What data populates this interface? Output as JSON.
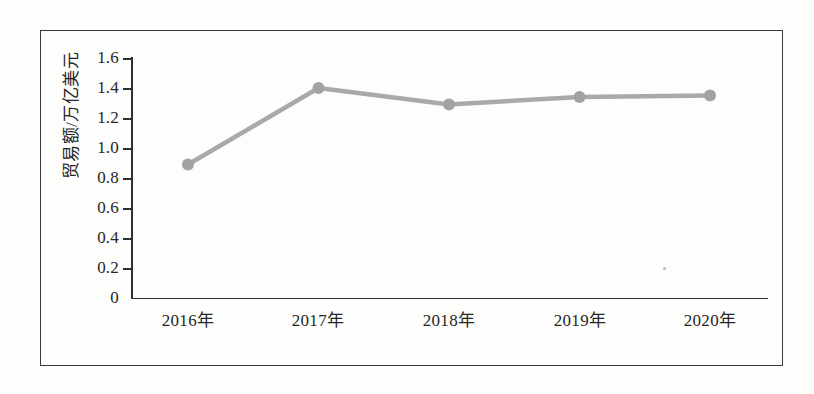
{
  "chart_data": {
    "type": "line",
    "title": "",
    "xlabel": "",
    "ylabel": "贸易额/万亿美元",
    "categories": [
      "2016年",
      "2017年",
      "2018年",
      "2019年",
      "2020年"
    ],
    "values": [
      0.89,
      1.4,
      1.29,
      1.34,
      1.35
    ],
    "series": [
      {
        "name": "贸易额",
        "values": [
          0.89,
          1.4,
          1.29,
          1.34,
          1.35
        ]
      }
    ],
    "ylim": [
      0,
      1.6
    ],
    "y_ticks": [
      "1.6",
      "1.4",
      "1.2",
      "1.0",
      "0.8",
      "0.6",
      "0.4",
      "0.2",
      "0"
    ],
    "y_tick_values": [
      1.6,
      1.4,
      1.2,
      1.0,
      0.8,
      0.6,
      0.4,
      0.2,
      0
    ],
    "grid": false,
    "legend": "none",
    "line_color": "#a9a9a9",
    "marker_color": "#a2a2a2",
    "axis_color": "#2e2e2e"
  },
  "figure": {
    "border_color": "#3a3a3a",
    "background": "#fdfdfc"
  }
}
